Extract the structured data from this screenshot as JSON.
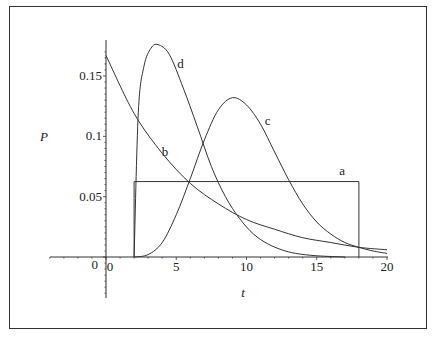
{
  "chart_data": {
    "type": "line",
    "title": "",
    "xlabel": "t",
    "ylabel": "P",
    "xlim": [
      -4,
      20
    ],
    "ylim": [
      -0.04,
      0.18
    ],
    "grid": false,
    "legend": "inline curve labels",
    "x_ticks": [
      0,
      5,
      10,
      15,
      20
    ],
    "y_ticks": [
      0.05,
      0.1,
      0.15
    ],
    "origin_label": "0",
    "series": [
      {
        "name": "a",
        "kind": "uniform",
        "params": {
          "a": 2,
          "b": 18
        },
        "description": "Uniform density on [2,18], height 0.0625",
        "label_at": [
          16.8,
          0.068
        ]
      },
      {
        "name": "b",
        "kind": "exponential",
        "params": {
          "mean": 6
        },
        "description": "Exponential density, P(0)=0.167",
        "label_at": [
          4.2,
          0.084
        ]
      },
      {
        "name": "c",
        "kind": "peaked",
        "params": {
          "mode": 9,
          "peak": 0.132,
          "start": 2
        },
        "description": "Unimodal density starting at t=2, peak ~0.13 near t=9",
        "label_at": [
          11.5,
          0.109
        ]
      },
      {
        "name": "d",
        "kind": "peaked",
        "params": {
          "mode": 3.7,
          "peak": 0.176,
          "start": 2
        },
        "description": "Unimodal density starting at t=2, peak ~0.175 near t=3.7",
        "label_at": [
          5.3,
          0.157
        ]
      }
    ],
    "sample_points": {
      "a": {
        "x": [
          2,
          2,
          18,
          18
        ],
        "y": [
          0,
          0.0625,
          0.0625,
          0
        ]
      },
      "b": {
        "x": [
          0,
          2,
          4,
          6,
          8,
          10,
          12,
          14,
          16,
          18,
          20
        ],
        "y": [
          0.167,
          0.119,
          0.086,
          0.061,
          0.044,
          0.031,
          0.023,
          0.016,
          0.012,
          0.008,
          0.006
        ]
      },
      "c": {
        "x": [
          2,
          3,
          4,
          5,
          6,
          7,
          8,
          9,
          10,
          11,
          12,
          13,
          14,
          15,
          16,
          17,
          18,
          19,
          20
        ],
        "y": [
          0,
          0.002,
          0.012,
          0.035,
          0.065,
          0.097,
          0.122,
          0.132,
          0.126,
          0.11,
          0.087,
          0.064,
          0.044,
          0.029,
          0.019,
          0.012,
          0.008,
          0.005,
          0.003
        ]
      },
      "d": {
        "x": [
          2,
          2.3,
          2.7,
          3.2,
          3.7,
          4.5,
          5.5,
          6.5,
          7.5,
          8.5,
          9.5,
          10.5,
          11.5,
          12.5,
          13.5,
          15,
          17
        ],
        "y": [
          0,
          0.12,
          0.158,
          0.173,
          0.176,
          0.168,
          0.14,
          0.108,
          0.075,
          0.05,
          0.032,
          0.019,
          0.011,
          0.006,
          0.003,
          0.001,
          0
        ]
      }
    }
  }
}
